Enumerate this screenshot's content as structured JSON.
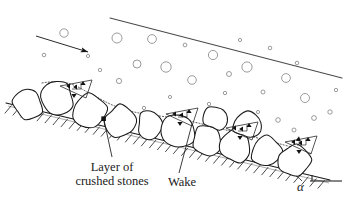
{
  "figure": {
    "kind": "schematic-diagram",
    "background_color": "#ffffff",
    "ink_color": "#1a1a1a",
    "bubble_color": "#8a8a8a",
    "width": 350,
    "height": 215
  },
  "labels": {
    "crushed_stones": "Layer of\ncrushed stones",
    "crushed_stones_line1": "Layer of",
    "crushed_stones_line2": "crushed stones",
    "wake": "Wake",
    "alpha": "α"
  },
  "annotations": {
    "flow_arrow": {
      "name": "flow-direction-arrow",
      "x1": 36,
      "y1": 36,
      "x2": 92,
      "y2": 53
    },
    "free_surface": {
      "name": "free-water-surface-line",
      "x1": 110,
      "y1": 18,
      "x2": 342,
      "y2": 78
    },
    "slope_angle": {
      "name": "slope-angle-alpha",
      "vertex_x": 318,
      "vertex_y": 180,
      "horizontal_x2": 340,
      "horizontal_y2": 180
    },
    "leader_crushed_stones": {
      "name": "leader-line-crushed-stones",
      "x1": 112,
      "y1": 158,
      "x2": 104,
      "y2": 119
    },
    "leader_wake": {
      "name": "leader-line-wake",
      "x1": 180,
      "y1": 172,
      "x2": 193,
      "y2": 123
    }
  },
  "bubbles": [
    {
      "cx": 64,
      "cy": 33,
      "r": 4.2
    },
    {
      "cx": 44,
      "cy": 55,
      "r": 1.8
    },
    {
      "cx": 117,
      "cy": 38,
      "r": 5.0
    },
    {
      "cx": 100,
      "cy": 70,
      "r": 1.7
    },
    {
      "cx": 137,
      "cy": 64,
      "r": 4.0
    },
    {
      "cx": 119,
      "cy": 81,
      "r": 2.6
    },
    {
      "cx": 166,
      "cy": 67,
      "r": 5.2
    },
    {
      "cx": 152,
      "cy": 39,
      "r": 4.4
    },
    {
      "cx": 185,
      "cy": 45,
      "r": 1.9
    },
    {
      "cx": 192,
      "cy": 80,
      "r": 4.3
    },
    {
      "cx": 213,
      "cy": 55,
      "r": 4.6
    },
    {
      "cx": 229,
      "cy": 74,
      "r": 2.5
    },
    {
      "cx": 225,
      "cy": 93,
      "r": 1.7
    },
    {
      "cx": 247,
      "cy": 67,
      "r": 5.1
    },
    {
      "cx": 263,
      "cy": 92,
      "r": 2.0
    },
    {
      "cx": 270,
      "cy": 48,
      "r": 1.8
    },
    {
      "cx": 286,
      "cy": 78,
      "r": 4.4
    },
    {
      "cx": 297,
      "cy": 63,
      "r": 1.8
    },
    {
      "cx": 305,
      "cy": 98,
      "r": 4.5
    },
    {
      "cx": 314,
      "cy": 118,
      "r": 2.4
    },
    {
      "cx": 330,
      "cy": 112,
      "r": 2.2
    },
    {
      "cx": 336,
      "cy": 90,
      "r": 1.7
    },
    {
      "cx": 278,
      "cy": 120,
      "r": 2.3
    },
    {
      "cx": 294,
      "cy": 130,
      "r": 2.0
    },
    {
      "cx": 258,
      "cy": 112,
      "r": 1.6
    },
    {
      "cx": 209,
      "cy": 104,
      "r": 1.7
    },
    {
      "cx": 170,
      "cy": 97,
      "r": 1.6
    },
    {
      "cx": 144,
      "cy": 108,
      "r": 1.7
    },
    {
      "cx": 88,
      "cy": 56,
      "r": 1.6
    },
    {
      "cx": 240,
      "cy": 40,
      "r": 1.6
    }
  ],
  "stones": [
    {
      "name": "stone-1",
      "cx": 28,
      "cy": 104,
      "rx": 14,
      "ry": 16,
      "rot": -14
    },
    {
      "name": "stone-2",
      "cx": 57,
      "cy": 97,
      "rx": 17,
      "ry": 18,
      "rot": -12
    },
    {
      "name": "stone-3",
      "cx": 88,
      "cy": 111,
      "rx": 18,
      "ry": 16,
      "rot": -10
    },
    {
      "name": "stone-4",
      "cx": 120,
      "cy": 122,
      "rx": 16,
      "ry": 17,
      "rot": -10
    },
    {
      "name": "stone-5",
      "cx": 150,
      "cy": 126,
      "rx": 13,
      "ry": 15,
      "rot": -8
    },
    {
      "name": "stone-6",
      "cx": 178,
      "cy": 131,
      "rx": 17,
      "ry": 17,
      "rot": -8
    },
    {
      "name": "stone-7",
      "cx": 207,
      "cy": 140,
      "rx": 15,
      "ry": 16,
      "rot": -6
    },
    {
      "name": "stone-8",
      "cx": 236,
      "cy": 146,
      "rx": 16,
      "ry": 16,
      "rot": -6
    },
    {
      "name": "stone-9",
      "cx": 266,
      "cy": 152,
      "rx": 15,
      "ry": 16,
      "rot": -5
    },
    {
      "name": "stone-10",
      "cx": 295,
      "cy": 161,
      "rx": 16,
      "ry": 17,
      "rot": -4
    },
    {
      "name": "stone-11",
      "cx": 247,
      "cy": 124,
      "rx": 14,
      "ry": 14,
      "rot": -6
    },
    {
      "name": "stone-12",
      "cx": 216,
      "cy": 118,
      "rx": 12,
      "ry": 12,
      "rot": -6
    }
  ],
  "wake_clusters": [
    {
      "name": "wake-cluster-left",
      "x": 70,
      "y": 84
    },
    {
      "name": "wake-cluster-mid-left",
      "x": 176,
      "y": 112
    },
    {
      "name": "wake-cluster-mid-right",
      "x": 236,
      "y": 126
    },
    {
      "name": "wake-cluster-right",
      "x": 295,
      "y": 140
    }
  ]
}
